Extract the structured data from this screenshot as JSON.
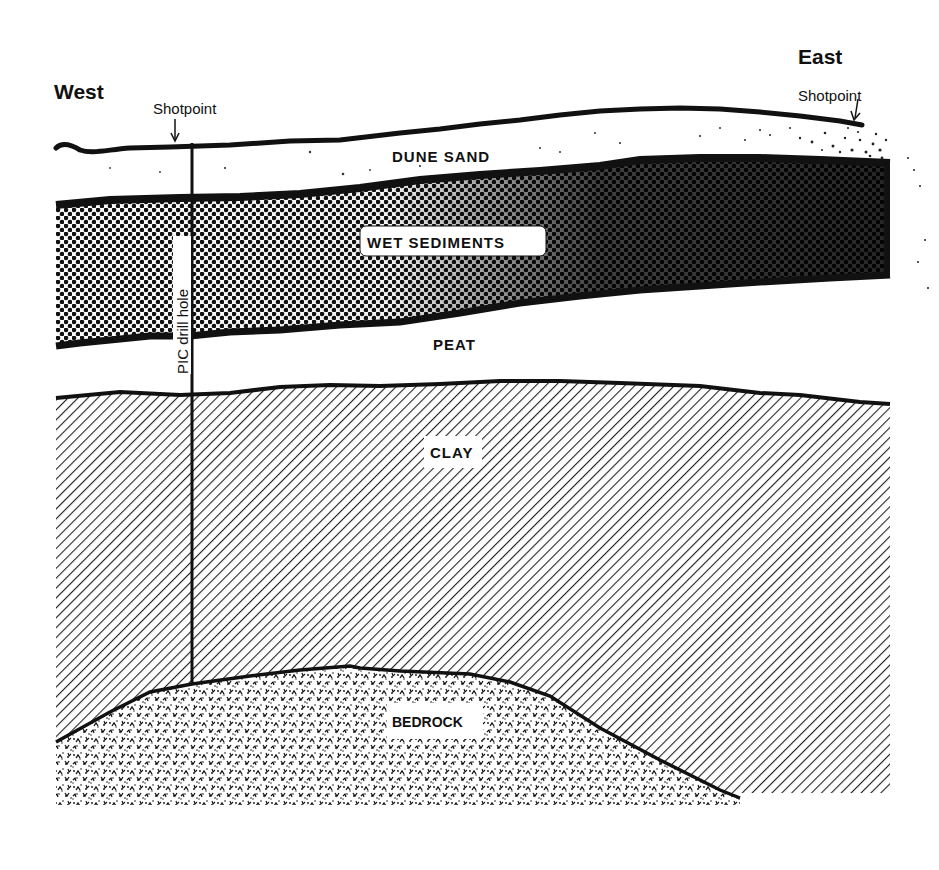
{
  "diagram": {
    "type": "geologic-cross-section",
    "directions": {
      "left": "West",
      "right": "East"
    },
    "markers": {
      "shotpoint_west": "Shotpoint",
      "shotpoint_east": "Shotpoint",
      "drill_hole": "PIC drill hole"
    },
    "layers": [
      {
        "name": "DUNE SAND",
        "pattern": "sparse-speckle",
        "order": 1
      },
      {
        "name": "WET SEDIMENTS",
        "pattern": "dense-dots-dark",
        "order": 2
      },
      {
        "name": "PEAT",
        "pattern": "blank",
        "order": 3
      },
      {
        "name": "CLAY",
        "pattern": "diagonal-hatch",
        "order": 4
      },
      {
        "name": "BEDROCK",
        "pattern": "stipple-chevrons",
        "order": 5
      }
    ],
    "colors": {
      "ink": "#111111",
      "paper": "#ffffff"
    }
  }
}
